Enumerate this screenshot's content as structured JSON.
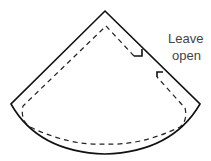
{
  "diagram": {
    "annotation": {
      "line1": "Leave",
      "line2": "open"
    },
    "colors": {
      "outline": "#111111",
      "seam": "#222222",
      "text": "#444444",
      "background": "#ffffff"
    },
    "parts": [
      {
        "name": "cutting-outline",
        "style": "solid"
      },
      {
        "name": "seam-line",
        "style": "dashed"
      },
      {
        "name": "opening-markers",
        "count": 2
      }
    ]
  }
}
